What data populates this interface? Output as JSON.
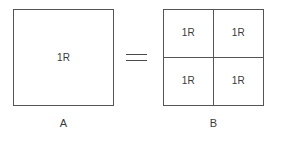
{
  "diagram": {
    "type": "resistance-equivalence",
    "background_color": "#ffffff",
    "line_color": "#555555",
    "text_color": "#3a3a3a",
    "figures": [
      {
        "id": "A",
        "caption": "A",
        "subdivisions": 1,
        "cells": [
          {
            "label": "1R"
          }
        ]
      },
      {
        "id": "B",
        "caption": "B",
        "subdivisions": 4,
        "cells": [
          {
            "label": "1R"
          },
          {
            "label": "1R"
          },
          {
            "label": "1R"
          },
          {
            "label": "1R"
          }
        ]
      }
    ],
    "operator": {
      "name": "equals",
      "symbol": "="
    }
  }
}
